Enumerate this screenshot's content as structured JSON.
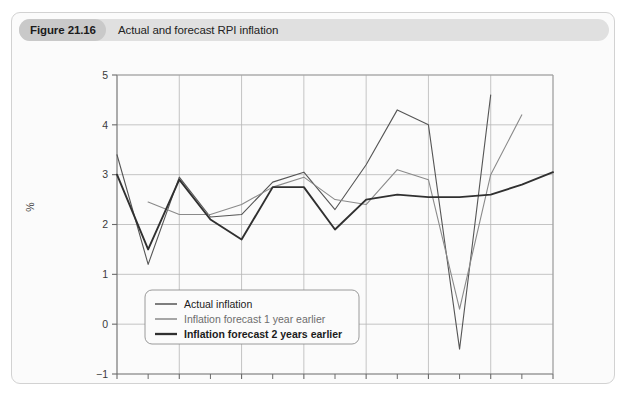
{
  "figure": {
    "number": "Figure 21.16",
    "title": "Actual and forecast RPI inflation"
  },
  "chart_data": {
    "type": "line",
    "title": "Actual and forecast RPI inflation",
    "xlabel": "",
    "ylabel": "%",
    "xlim": [
      1998,
      2012
    ],
    "ylim": [
      -1,
      5
    ],
    "ytick_labels": [
      "5",
      "4",
      "3",
      "2",
      "1",
      "0",
      "−1"
    ],
    "yticks": [
      5,
      4,
      3,
      2,
      1,
      0,
      -1
    ],
    "xtick_labels": [
      "1998",
      "2000",
      "2002",
      "2004",
      "2006",
      "2008",
      "2010",
      "2012"
    ],
    "xticks": [
      1998,
      2000,
      2002,
      2004,
      2006,
      2008,
      2010,
      2012
    ],
    "xticks_minor": [
      1999,
      2001,
      2003,
      2005,
      2007,
      2009,
      2011
    ],
    "grid": true,
    "legend_position": "lower-left",
    "series": [
      {
        "name": "Actual inflation",
        "color": "#555555",
        "width": 1.1,
        "x": [
          1998,
          1999,
          2000,
          2001,
          2002,
          2003,
          2004,
          2005,
          2006,
          2007,
          2008,
          2009,
          2010
        ],
        "values": [
          3.4,
          1.2,
          2.95,
          2.15,
          2.2,
          2.85,
          3.05,
          2.3,
          3.2,
          4.3,
          4.0,
          -0.5,
          4.6
        ]
      },
      {
        "name": "Inflation forecast 1 year earlier",
        "color": "#8a8a8a",
        "width": 1.1,
        "x": [
          1999,
          2000,
          2001,
          2002,
          2003,
          2004,
          2005,
          2006,
          2007,
          2008,
          2009,
          2010,
          2011
        ],
        "values": [
          2.45,
          2.2,
          2.2,
          2.4,
          2.75,
          2.95,
          2.5,
          2.4,
          3.1,
          2.9,
          0.3,
          3.0,
          4.2
        ]
      },
      {
        "name": "Inflation forecast 2 years earlier",
        "color": "#303030",
        "width": 1.9,
        "x": [
          1998,
          1999,
          2000,
          2001,
          2002,
          2003,
          2004,
          2005,
          2006,
          2007,
          2008,
          2009,
          2010,
          2011,
          2012
        ],
        "values": [
          3.0,
          1.5,
          2.9,
          2.1,
          1.7,
          2.75,
          2.75,
          1.9,
          2.5,
          2.6,
          2.55,
          2.55,
          2.6,
          2.8,
          3.05
        ]
      }
    ]
  }
}
